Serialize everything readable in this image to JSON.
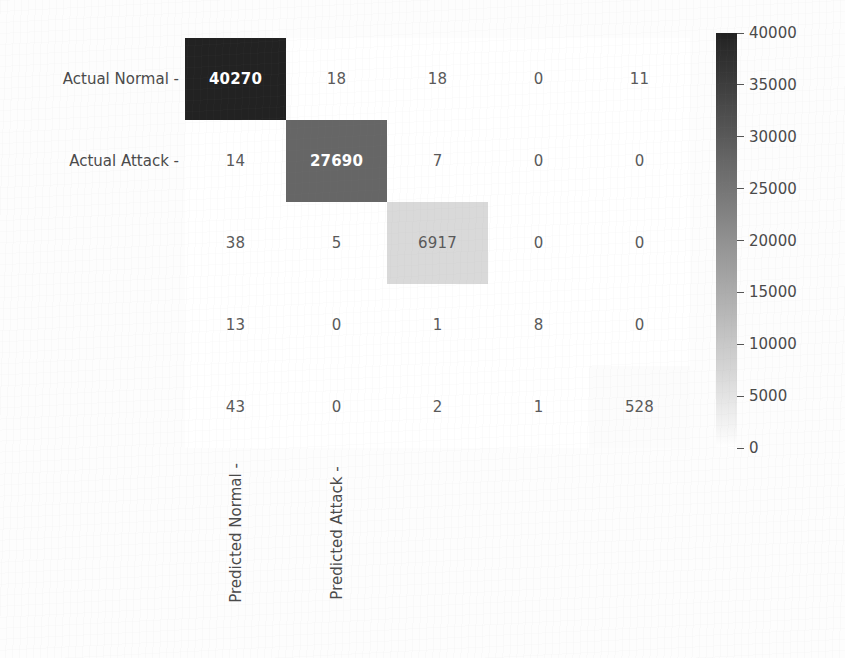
{
  "chart_data": {
    "type": "heatmap",
    "title": "",
    "xlabel": "",
    "ylabel": "",
    "x_categories": [
      "Predicted Normal -",
      "Predicted Attack -",
      "",
      "",
      ""
    ],
    "y_categories": [
      "Actual Normal -",
      "Actual Attack -",
      "",
      "",
      ""
    ],
    "matrix": [
      [
        40270,
        18,
        18,
        0,
        11
      ],
      [
        14,
        27690,
        7,
        0,
        0
      ],
      [
        38,
        5,
        6917,
        0,
        0
      ],
      [
        13,
        0,
        1,
        8,
        0
      ],
      [
        43,
        0,
        2,
        1,
        528
      ]
    ],
    "colorbar": {
      "ticks": [
        40000,
        35000,
        30000,
        25000,
        20000,
        15000,
        10000,
        5000,
        0
      ],
      "tick_labels": [
        "40000",
        "35000",
        "30000",
        "25000",
        "20000",
        "15000",
        "10000",
        "5000",
        "0"
      ],
      "vmin": 0,
      "vmax": 40000,
      "colormap": "greys",
      "orientation": "vertical",
      "position": "right"
    },
    "grid": false,
    "annotations_shown": true,
    "colors": {
      "cell_min": "#ffffff",
      "cell_max": "#242424",
      "text_dark": "#5a5a5a",
      "text_light": "#ffffff",
      "background": "#fdfdfd"
    }
  }
}
